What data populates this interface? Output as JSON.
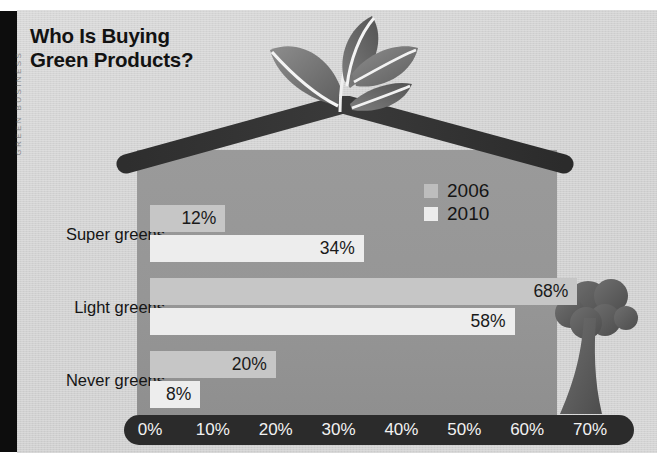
{
  "page": {
    "gutter_text": "GREEN BUSINESS",
    "title_line1": "Who Is Buying",
    "title_line2": "Green Products?"
  },
  "legend": {
    "items": [
      {
        "label": "2006",
        "swatch": "#bdbdbd",
        "swatch_name": "legend-swatch-2006"
      },
      {
        "label": "2010",
        "swatch": "#ececec",
        "swatch_name": "legend-swatch-2010"
      }
    ]
  },
  "illustrations": {
    "roof": "house-roof-chevron",
    "house": "house-body",
    "sprout": "sprout-plant-icon",
    "tree": "tree-icon"
  },
  "chart_data": {
    "type": "bar",
    "orientation": "horizontal",
    "title": "Who Is Buying Green Products?",
    "xlabel": "",
    "ylabel": "",
    "categories": [
      "Super greens",
      "Light greens",
      "Never greens"
    ],
    "series": [
      {
        "name": "2006",
        "color": "#c6c6c6",
        "values": [
          12,
          68,
          20
        ],
        "labels": [
          "12%",
          "68%",
          "20%"
        ]
      },
      {
        "name": "2010",
        "color": "#ededed",
        "values": [
          34,
          58,
          8
        ],
        "labels": [
          "34%",
          "58%",
          "8%"
        ]
      }
    ],
    "xlim": [
      0,
      70
    ],
    "xticks": [
      0,
      10,
      20,
      30,
      40,
      50,
      60,
      70
    ],
    "xtick_labels": [
      "0%",
      "10%",
      "20%",
      "30%",
      "40%",
      "50%",
      "60%",
      "70%"
    ],
    "grid": false,
    "legend_position": "inside-upper-right",
    "value_label_position": "bar-end-inside"
  }
}
